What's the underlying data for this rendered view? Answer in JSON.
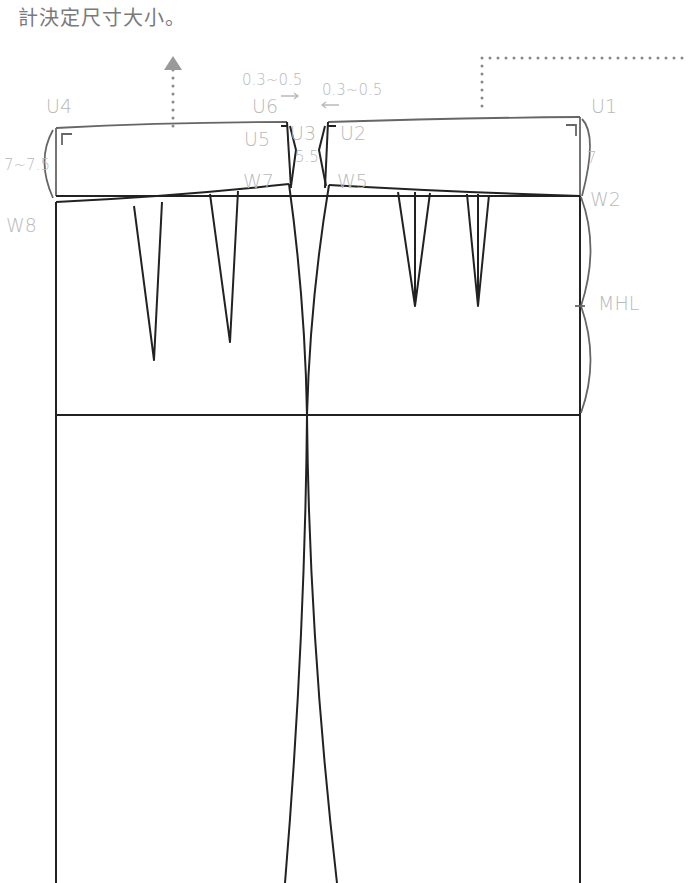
{
  "caption": "計決定尺寸大小。",
  "labels": {
    "u4": "U4",
    "u6": "U6",
    "u5": "U5",
    "u3": "U3",
    "u2": "U2",
    "u1": "U1",
    "w8": "W8",
    "w7": "W7",
    "w5": "W5",
    "w2": "W2",
    "mhl": "MHL",
    "left_height": "7~7.5",
    "right_height": "7",
    "center_height": "5.5",
    "offset_left": "0.3~0.5",
    "offset_right": "0.3~0.5"
  },
  "colors": {
    "line": "#222222",
    "label": "#b9b9b9",
    "dotted_guide": "#8a8a8a",
    "arrow_head": "#9a9a9a",
    "caption": "#7a7a7a"
  },
  "icons": {
    "up_arrow": "up-triangle-arrow",
    "offset_arrow_right": "right-arrow",
    "offset_arrow_left": "left-arrow"
  }
}
